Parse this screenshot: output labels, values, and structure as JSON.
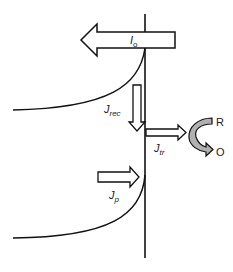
{
  "diagram": {
    "labels": {
      "io": {
        "main": "I",
        "sub": "o"
      },
      "jrec": {
        "main": "J",
        "sub": "rec"
      },
      "jtr": {
        "main": "J",
        "sub": "tr"
      },
      "jp": {
        "main": "J",
        "sub": "p"
      },
      "r": "R",
      "o": "O"
    },
    "colors": {
      "stroke": "#111111",
      "arrow_fill": "#ffffff",
      "redox_arrow_fill": "#b0b0b0",
      "background": "#ffffff"
    }
  }
}
